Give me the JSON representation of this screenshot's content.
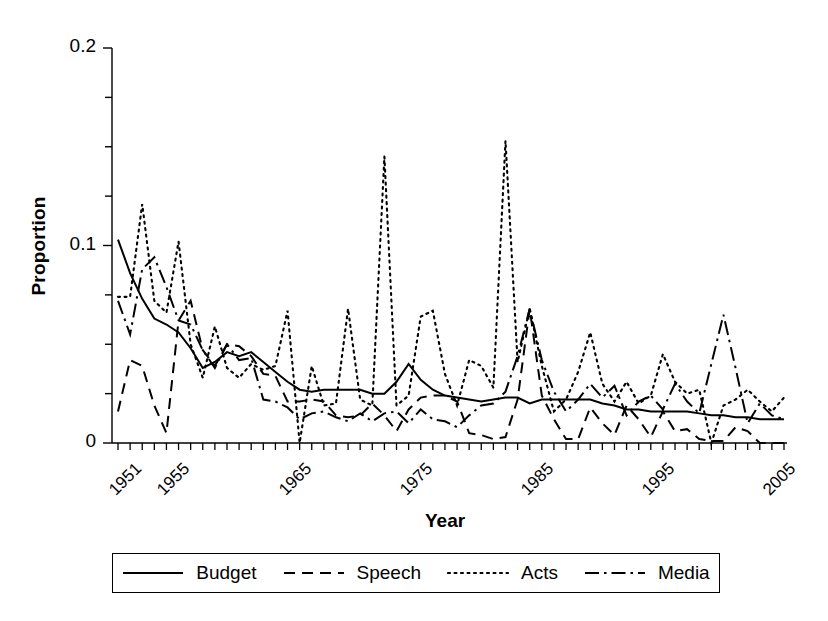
{
  "figure": {
    "axis_labels": {
      "x": "Year",
      "y": "Proportion"
    },
    "y_tick_labels": [
      "0.2",
      "0.1",
      "0"
    ],
    "y_tick_values": [
      0.2,
      0.1,
      0
    ],
    "x_tick_labels": [
      "1951",
      "1955",
      "1965",
      "1975",
      "1985",
      "1995",
      "2005"
    ],
    "x_tick_values": [
      1951,
      1955,
      1965,
      1975,
      1985,
      1995,
      2005
    ]
  },
  "legend": {
    "items": [
      {
        "label": "Budget",
        "dash": "none",
        "key_name": "legend-key-budget"
      },
      {
        "label": "Speech",
        "dash": "dash",
        "key_name": "legend-key-speech"
      },
      {
        "label": "Acts",
        "dash": "dot",
        "key_name": "legend-key-acts"
      },
      {
        "label": "Media",
        "dash": "dashdot",
        "key_name": "legend-key-media"
      }
    ]
  },
  "chart_data": {
    "type": "line",
    "title": "",
    "xlabel": "Year",
    "ylabel": "Proportion",
    "xlim": [
      1951,
      2006
    ],
    "ylim": [
      0,
      0.2
    ],
    "grid": false,
    "legend_position": "bottom",
    "y_minor_tick_step": 0.025,
    "x_minor_tick_step": 1,
    "x": [
      1951,
      1952,
      1953,
      1954,
      1955,
      1956,
      1957,
      1958,
      1959,
      1960,
      1961,
      1962,
      1963,
      1964,
      1965,
      1966,
      1967,
      1968,
      1969,
      1970,
      1971,
      1972,
      1973,
      1974,
      1975,
      1976,
      1977,
      1978,
      1979,
      1980,
      1981,
      1982,
      1983,
      1984,
      1985,
      1986,
      1987,
      1988,
      1989,
      1990,
      1991,
      1992,
      1993,
      1994,
      1995,
      1996,
      1997,
      1998,
      1999,
      2000,
      2001,
      2002,
      2003,
      2004,
      2005,
      2006
    ],
    "series": [
      {
        "name": "Budget",
        "dash": "none",
        "values": [
          0.103,
          0.086,
          0.073,
          0.063,
          0.06,
          0.056,
          0.048,
          0.038,
          0.041,
          0.046,
          0.044,
          0.046,
          0.041,
          0.036,
          0.031,
          0.027,
          0.026,
          0.027,
          0.027,
          0.027,
          0.027,
          0.025,
          0.025,
          0.031,
          0.04,
          0.032,
          0.027,
          0.024,
          0.023,
          0.022,
          0.021,
          0.022,
          0.023,
          0.023,
          0.02,
          0.022,
          0.022,
          0.022,
          0.022,
          0.022,
          0.02,
          0.019,
          0.017,
          0.017,
          0.016,
          0.016,
          0.016,
          0.016,
          0.015,
          0.014,
          0.014,
          0.013,
          0.013,
          0.012,
          0.012,
          0.012
        ]
      },
      {
        "name": "Speech",
        "dash": "dash",
        "values": [
          0.016,
          0.042,
          0.039,
          0.019,
          0.005,
          0.062,
          0.072,
          0.047,
          0.039,
          0.05,
          0.049,
          0.044,
          0.035,
          0.034,
          0.021,
          0.021,
          0.022,
          0.021,
          0.014,
          0.013,
          0.014,
          0.02,
          0.014,
          0.006,
          0.017,
          0.023,
          0.024,
          0.024,
          0.021,
          0.005,
          0.004,
          0.002,
          0.003,
          0.022,
          0.068,
          0.024,
          0.012,
          0.002,
          0.002,
          0.018,
          0.01,
          0.004,
          0.019,
          0.012,
          0.003,
          0.016,
          0.006,
          0.007,
          0.002,
          0.001,
          0.001,
          0.008,
          0.006,
          0.0,
          0.0,
          0.0
        ]
      },
      {
        "name": "Acts",
        "dash": "dot",
        "values": [
          0.074,
          0.074,
          0.121,
          0.072,
          0.066,
          0.102,
          0.05,
          0.033,
          0.059,
          0.038,
          0.033,
          0.04,
          0.037,
          0.039,
          0.067,
          0.0,
          0.039,
          0.019,
          0.02,
          0.068,
          0.022,
          0.019,
          0.145,
          0.019,
          0.024,
          0.064,
          0.067,
          0.035,
          0.019,
          0.042,
          0.039,
          0.028,
          0.153,
          0.041,
          0.068,
          0.039,
          0.016,
          0.022,
          0.036,
          0.056,
          0.03,
          0.021,
          0.031,
          0.02,
          0.024,
          0.045,
          0.031,
          0.025,
          0.027,
          0.0,
          0.019,
          0.022,
          0.027,
          0.021,
          0.016,
          0.023
        ]
      },
      {
        "name": "Media",
        "dash": "dashdot",
        "values": [
          0.072,
          0.055,
          0.088,
          0.094,
          0.079,
          0.062,
          0.06,
          0.047,
          0.038,
          0.05,
          0.042,
          0.043,
          0.022,
          0.021,
          0.018,
          0.012,
          0.015,
          0.016,
          0.013,
          0.011,
          0.015,
          0.011,
          0.015,
          0.016,
          0.01,
          0.017,
          0.012,
          0.011,
          0.008,
          0.014,
          0.019,
          0.02,
          0.026,
          0.044,
          0.068,
          0.042,
          0.026,
          0.016,
          0.022,
          0.03,
          0.023,
          0.029,
          0.014,
          0.021,
          0.024,
          0.017,
          0.03,
          0.021,
          0.015,
          0.04,
          0.065,
          0.038,
          0.01,
          0.02,
          0.014,
          0.012
        ]
      }
    ]
  }
}
